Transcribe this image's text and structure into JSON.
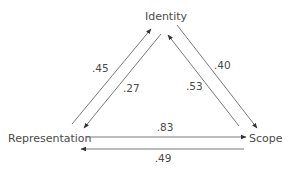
{
  "diagram": {
    "nodes": {
      "identity": "Identity",
      "representation": "Representation",
      "scope": "Scope"
    },
    "edges": [
      {
        "from": "Representation",
        "to": "Identity",
        "weight": ".45"
      },
      {
        "from": "Identity",
        "to": "Representation",
        "weight": ".27"
      },
      {
        "from": "Scope",
        "to": "Identity",
        "weight": ".53"
      },
      {
        "from": "Identity",
        "to": "Scope",
        "weight": ".40"
      },
      {
        "from": "Representation",
        "to": "Scope",
        "weight": ".83"
      },
      {
        "from": "Scope",
        "to": "Representation",
        "weight": ".49"
      }
    ],
    "colors": {
      "line": "#555555",
      "text": "#4a4a4a",
      "background": "#ffffff"
    }
  }
}
